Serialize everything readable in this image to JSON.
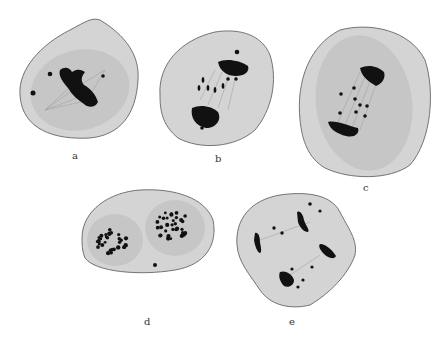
{
  "figure": {
    "panels": [
      {
        "id": "a",
        "label": "a",
        "stage": "metaphase"
      },
      {
        "id": "b",
        "label": "b",
        "stage": "early anaphase"
      },
      {
        "id": "c",
        "label": "c",
        "stage": "anaphase"
      },
      {
        "id": "d",
        "label": "d",
        "stage": "telophase (two chromosome groups)"
      },
      {
        "id": "e",
        "label": "e",
        "stage": "multipolar division"
      }
    ],
    "colors": {
      "background": "#ffffff",
      "cytoplasm": "#d4d4d4",
      "spindle_region": "#c6c6c6",
      "chromosomes": "#111111"
    }
  }
}
